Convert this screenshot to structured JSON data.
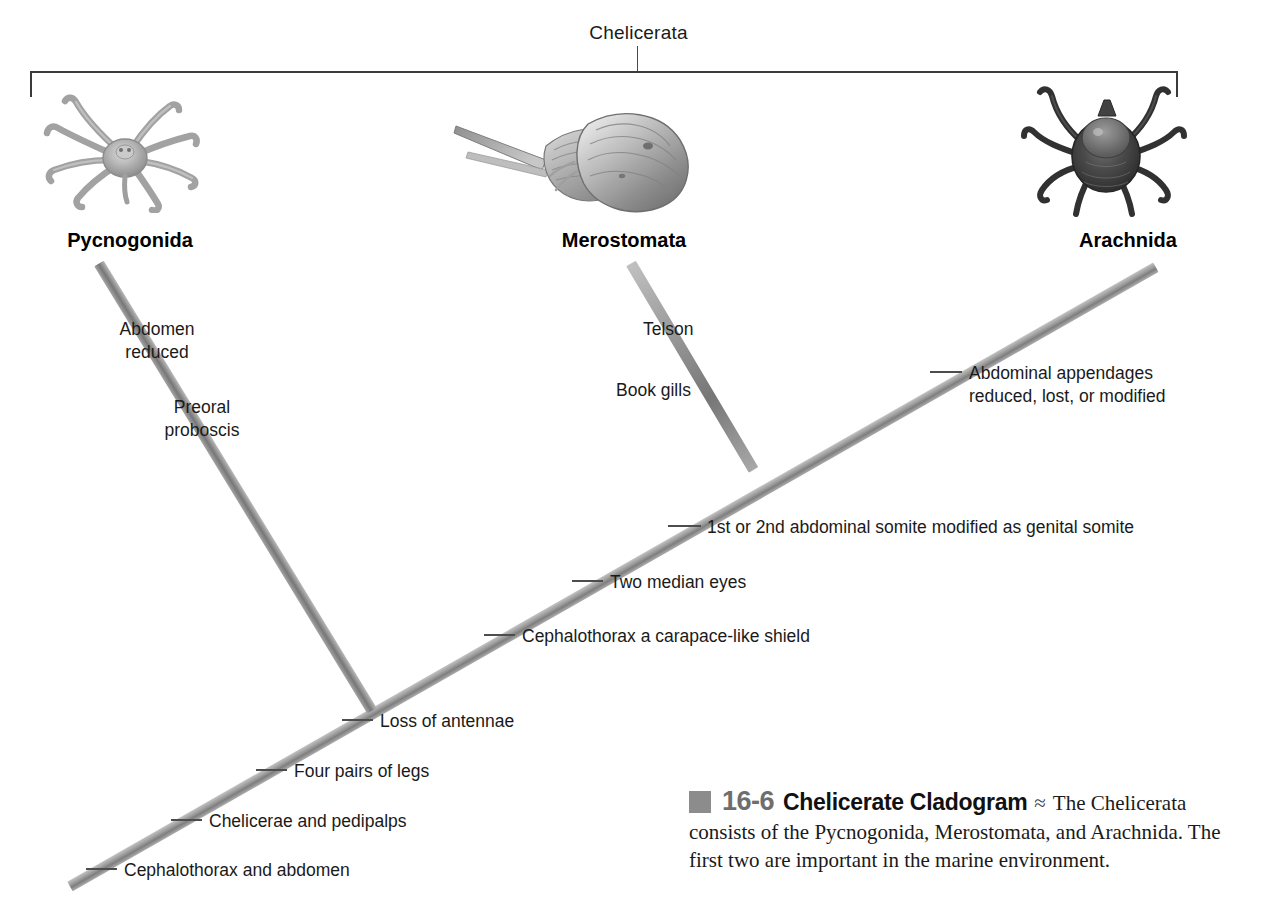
{
  "figure": {
    "clade_bracket_label": "Chelicerata",
    "taxa": [
      {
        "name": "Pycnogonida",
        "illustration": "sea-spider-illustration"
      },
      {
        "name": "Merostomata",
        "illustration": "horseshoe-crab-illustration"
      },
      {
        "name": "Arachnida",
        "illustration": "tick-illustration"
      }
    ],
    "characters": [
      {
        "id": "abdomen-reduced",
        "line1": "Abdomen",
        "line2": "reduced"
      },
      {
        "id": "preoral-proboscis",
        "line1": "Preoral",
        "line2": "proboscis"
      },
      {
        "id": "telson",
        "line1": "Telson",
        "line2": ""
      },
      {
        "id": "book-gills",
        "line1": "Book gills",
        "line2": ""
      },
      {
        "id": "abdominal-appendages",
        "line1": "Abdominal appendages",
        "line2": "reduced, lost, or modified"
      },
      {
        "id": "genital-somite",
        "line1": "1st or 2nd abdominal somite modified as genital somite",
        "line2": ""
      },
      {
        "id": "two-median-eyes",
        "line1": "Two median eyes",
        "line2": ""
      },
      {
        "id": "carapace-shield",
        "line1": "Cephalothorax a carapace-like shield",
        "line2": ""
      },
      {
        "id": "loss-of-antennae",
        "line1": "Loss of antennae",
        "line2": ""
      },
      {
        "id": "four-pairs-of-legs",
        "line1": "Four pairs of legs",
        "line2": ""
      },
      {
        "id": "chelicerae-pedipalps",
        "line1": "Chelicerae and pedipalps",
        "line2": ""
      },
      {
        "id": "cephalothorax-abdomen",
        "line1": "Cephalothorax and abdomen",
        "line2": ""
      }
    ],
    "caption": {
      "number": "16-6",
      "title": "Chelicerate Cladogram",
      "separator": "≈",
      "body_first": "The Chelicerata",
      "body_rest": "consists of the Pycnogonida, Merostomata, and Arachnida. The first two are important in the marine environment."
    },
    "colors": {
      "branch": "#8f8f8f",
      "tick": "#4d4d4d",
      "bracket": "#3a3a3a",
      "caption_swatch": "#8c8c8c",
      "caption_number": "#6e6e6e",
      "text": "#1a1a1a"
    }
  }
}
